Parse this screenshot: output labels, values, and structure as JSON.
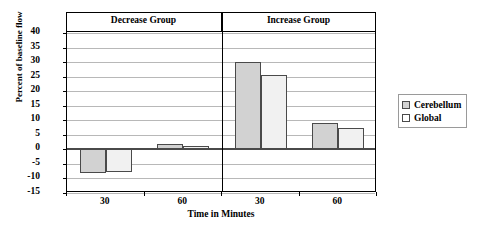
{
  "chart_data": {
    "type": "bar",
    "title": "",
    "xlabel": "Time in Minutes",
    "ylabel": "Percent of baseline flow",
    "ylim": [
      -15,
      40
    ],
    "ytick_step": 5,
    "yticks": [
      40,
      35,
      30,
      25,
      20,
      15,
      10,
      5,
      0,
      -5,
      -10,
      -15
    ],
    "ytick_labels": [
      "40",
      "35",
      "30",
      "25",
      "20",
      "15",
      "10",
      "5",
      "0",
      "-5",
      "-10",
      "-15"
    ],
    "grid": true,
    "legend_position": "right",
    "panels": [
      {
        "label": "Decrease Group"
      },
      {
        "label": "Increase Group"
      }
    ],
    "categories": [
      "30",
      "60",
      "30",
      "60"
    ],
    "category_panels": [
      0,
      0,
      1,
      1
    ],
    "series": [
      {
        "name": "Cerebellum",
        "color": "#d2d2d2",
        "values": [
          -8,
          2,
          30,
          9
        ]
      },
      {
        "name": "Global",
        "color": "#f1f1f1",
        "values": [
          -7.8,
          1.2,
          25.5,
          7.2
        ]
      }
    ],
    "legend": [
      {
        "label": "Cerebellum",
        "swatch": "#d2d2d2"
      },
      {
        "label": "Global",
        "swatch": "#ffffff"
      }
    ]
  }
}
